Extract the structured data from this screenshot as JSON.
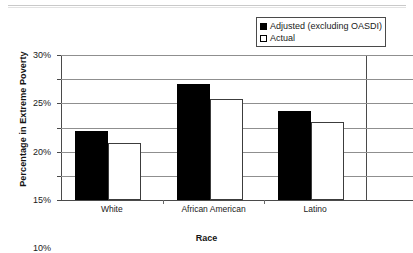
{
  "chart_data": {
    "type": "bar",
    "title": "",
    "xlabel": "Race",
    "ylabel": "Percentage in Extreme Poverty",
    "categories": [
      "White",
      "African American",
      "Latino"
    ],
    "series": [
      {
        "name": "Adjusted (excluding OASDI)",
        "values": [
          14.2,
          24.0,
          18.5
        ],
        "color": "#000000",
        "swatch": "filled"
      },
      {
        "name": "Actual",
        "values": [
          11.8,
          21.0,
          16.1
        ],
        "color": "#ffffff",
        "swatch": "hollow"
      }
    ],
    "ylim": [
      0,
      30
    ],
    "y_ticks": [
      0,
      5,
      10,
      15,
      20,
      25,
      30
    ],
    "y_tick_labels": [
      "0%",
      "5%",
      "10%",
      "15%",
      "20%",
      "25%",
      "30%"
    ],
    "grid": true,
    "legend_position": "top-right"
  },
  "legend": {
    "entries": [
      {
        "label": "Adjusted (excluding OASDI)"
      },
      {
        "label": "Actual"
      }
    ]
  }
}
